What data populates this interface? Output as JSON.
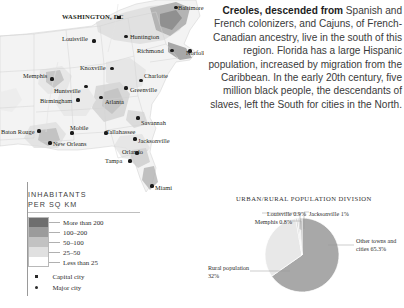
{
  "map": {
    "name": "southeast-united-states-population-density-map",
    "cities": [
      {
        "name": "WASHINGTON, DC",
        "type": "capital",
        "x": 119,
        "y": 17.5,
        "lx": 62,
        "ly": 13.5,
        "anchor": "left"
      },
      {
        "name": "Baltimore",
        "type": "major",
        "x": 176,
        "y": 7.5,
        "lx": 178,
        "ly": 4.5,
        "anchor": "left"
      },
      {
        "name": "Huntington",
        "type": "major",
        "x": 126,
        "y": 36.5,
        "lx": 130,
        "ly": 33.5,
        "anchor": "left"
      },
      {
        "name": "Louisville",
        "type": "major",
        "x": 94,
        "y": 41,
        "lx": 62,
        "ly": 36,
        "anchor": "left"
      },
      {
        "name": "Richmond",
        "type": "major",
        "x": 172,
        "y": 50.5,
        "lx": 137,
        "ly": 47.5,
        "anchor": "left"
      },
      {
        "name": "Norfolk",
        "type": "major",
        "x": 190,
        "y": 51,
        "lx": 186,
        "ly": 50,
        "anchor": "left"
      },
      {
        "name": "Knoxville",
        "type": "major",
        "x": 112,
        "y": 68.5,
        "lx": 80,
        "ly": 64.5,
        "anchor": "left"
      },
      {
        "name": "Memphis",
        "type": "major",
        "x": 52,
        "y": 79,
        "lx": 23,
        "ly": 73,
        "anchor": "left"
      },
      {
        "name": "Charlotte",
        "type": "major",
        "x": 141,
        "y": 80.5,
        "lx": 144,
        "ly": 72.5,
        "anchor": "left"
      },
      {
        "name": "Huntsville",
        "type": "major",
        "x": 86,
        "y": 86.5,
        "lx": 54,
        "ly": 88,
        "anchor": "left"
      },
      {
        "name": "Greenville",
        "type": "major",
        "x": 126,
        "y": 88,
        "lx": 130,
        "ly": 86.5,
        "anchor": "left"
      },
      {
        "name": "Birmingham",
        "type": "major",
        "x": 78,
        "y": 100,
        "lx": 40,
        "ly": 98,
        "anchor": "left"
      },
      {
        "name": "Atlanta",
        "type": "major",
        "x": 101,
        "y": 97.5,
        "lx": 105,
        "ly": 99,
        "anchor": "left"
      },
      {
        "name": "Savannah",
        "type": "major",
        "x": 138,
        "y": 118,
        "lx": 141,
        "ly": 119.5,
        "anchor": "left"
      },
      {
        "name": "Mobile",
        "type": "major",
        "x": 72,
        "y": 133,
        "lx": 70,
        "ly": 125,
        "anchor": "left"
      },
      {
        "name": "Tallahassee",
        "type": "major",
        "x": 106,
        "y": 133,
        "lx": 106,
        "ly": 129,
        "anchor": "left"
      },
      {
        "name": "Baton Rouge",
        "type": "major",
        "x": 39,
        "y": 131,
        "lx": 1,
        "ly": 129,
        "anchor": "left"
      },
      {
        "name": "Jacksonville",
        "type": "major",
        "x": 135,
        "y": 139,
        "lx": 138,
        "ly": 137.5,
        "anchor": "left"
      },
      {
        "name": "New Orleans",
        "type": "major",
        "x": 50,
        "y": 143,
        "lx": 53,
        "ly": 141,
        "anchor": "left"
      },
      {
        "name": "Orlando",
        "type": "major",
        "x": 137,
        "y": 153,
        "lx": 122,
        "ly": 149,
        "anchor": "left"
      },
      {
        "name": "Tampa",
        "type": "major",
        "x": 130,
        "y": 161,
        "lx": 105,
        "ly": 158,
        "anchor": "left"
      },
      {
        "name": "Miami",
        "type": "major",
        "x": 152,
        "y": 186,
        "lx": 155,
        "ly": 185,
        "anchor": "left"
      }
    ]
  },
  "story": {
    "lead": "Creoles, descended from",
    "body": " Spanish and French colonizers, and Cajuns, of French-Canadian ancestry, live in the south of this region. Florida has a large Hispanic population, increased by migration from the Caribbean. In the early 20th century, five million black people, the descendants of slaves, left the South for cities in the North."
  },
  "legend": {
    "title_line1": "INHABITANTS",
    "title_line2": "PER SQ KM",
    "classes": [
      {
        "label": "More than 200",
        "color": "#6e6e6e"
      },
      {
        "label": "100–200",
        "color": "#9b9b9b"
      },
      {
        "label": "50–100",
        "color": "#c2c2c2"
      },
      {
        "label": "25–50",
        "color": "#e0e0e0"
      },
      {
        "label": "Less than 25",
        "color": "#ffffff"
      }
    ],
    "markers": [
      {
        "label": "Capital city",
        "shape": "square"
      },
      {
        "label": "Major city",
        "shape": "dot"
      }
    ]
  },
  "chart_data": {
    "type": "pie",
    "title": "URBAN/RURAL POPULATION DIVISION",
    "categories": [
      "Other towns and cities",
      "Rural population",
      "Memphis",
      "Louisville",
      "Jacksonville"
    ],
    "values": [
      65.3,
      32,
      0.8,
      0.9,
      1
    ],
    "labels": [
      "Other towns and cities 65.3%",
      "Rural population 32%",
      "Memphis 0.8%",
      "Louisville 0.9%",
      "Jacksonville 1%"
    ],
    "colors": [
      "#a8a8a8",
      "#e8e8e8",
      "#c9c9c9",
      "#dcdcdc",
      "#bdbdbd"
    ],
    "legend": "callout-labels",
    "grid": false,
    "xlabel": "",
    "ylabel": ""
  }
}
